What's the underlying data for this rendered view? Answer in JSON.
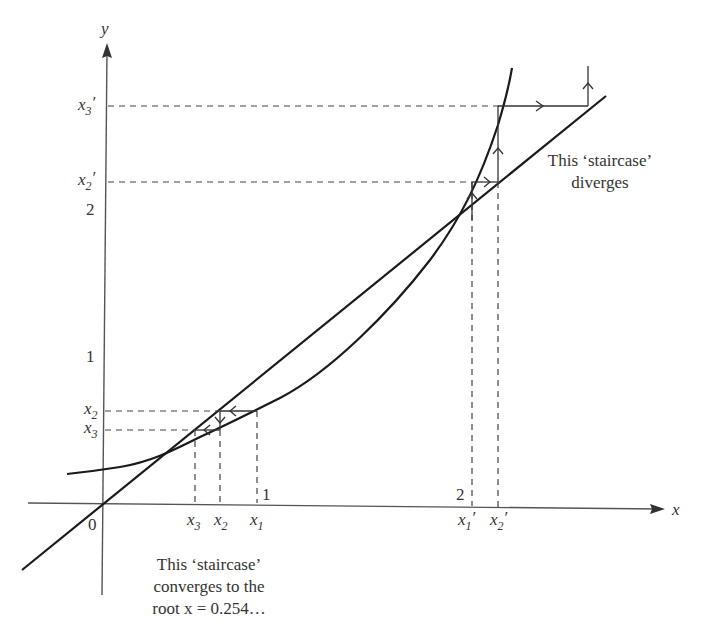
{
  "axes": {
    "x_label": "x",
    "y_label": "y",
    "origin_label": "0",
    "x_ticks": [
      "1",
      "2"
    ],
    "y_ticks": [
      "1",
      "2"
    ]
  },
  "labels": {
    "x1": {
      "base": "x",
      "sub": "1",
      "prime": ""
    },
    "x2": {
      "base": "x",
      "sub": "2",
      "prime": ""
    },
    "x3": {
      "base": "x",
      "sub": "3",
      "prime": ""
    },
    "x1p": {
      "base": "x",
      "sub": "1",
      "prime": "′"
    },
    "x2p": {
      "base": "x",
      "sub": "2",
      "prime": "′"
    },
    "x3p": {
      "base": "x",
      "sub": "3",
      "prime": "′"
    }
  },
  "annotations": {
    "diverge": [
      "This ‘staircase’",
      "diverges"
    ],
    "converge": [
      "This ‘staircase’",
      "converges to the",
      "root x = 0.254…"
    ]
  },
  "colors": {
    "ink": "#1a1a1a",
    "axis": "#555555",
    "background": "#ffffff"
  }
}
